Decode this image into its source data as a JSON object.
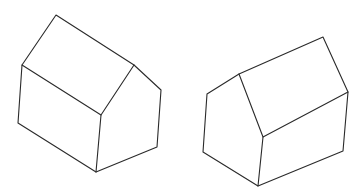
{
  "figure": {
    "width": 364,
    "height": 195,
    "background": "#ffffff",
    "stroke_color": "#2a2a2a",
    "shapes": [
      {
        "name": "house-left",
        "vertices": {
          "apex": [
            56,
            15
          ],
          "left_eave": [
            22,
            65
          ],
          "ridge_end": [
            134,
            65
          ],
          "right_gable_corner": [
            161,
            90
          ],
          "front_eave": [
            101,
            115
          ],
          "bottom_left": [
            18,
            123
          ],
          "bottom_front": [
            96,
            172
          ],
          "bottom_right": [
            157,
            147
          ]
        }
      },
      {
        "name": "house-right",
        "vertices": {
          "left_gable_corner": [
            207,
            94
          ],
          "gable_apex": [
            239,
            74
          ],
          "ridge_right": [
            323,
            37
          ],
          "right_eave": [
            348,
            92
          ],
          "front_eave": [
            263,
            137
          ],
          "bottom_left": [
            203,
            152
          ],
          "bottom_front": [
            258,
            186
          ],
          "bottom_right": [
            343,
            151
          ]
        }
      }
    ]
  }
}
